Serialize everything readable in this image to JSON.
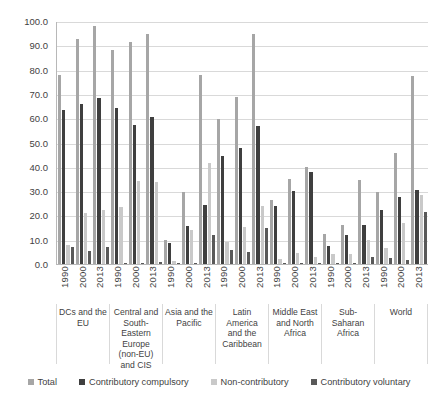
{
  "chart_data": {
    "type": "bar",
    "title": "",
    "subtitle": "",
    "xlabel": "",
    "ylabel": "",
    "ylim": [
      0,
      100
    ],
    "ytick_labels": [
      "100.0",
      "90.0",
      "80.0",
      "70.0",
      "60.0",
      "50.0",
      "40.0",
      "30.0",
      "20.0",
      "10.0",
      "0.0"
    ],
    "ytick_values": [
      100,
      90,
      80,
      70,
      60,
      50,
      40,
      30,
      20,
      10,
      0
    ],
    "grid": true,
    "legend_position": "bottom",
    "colors": {
      "total": "#a6a6a6",
      "contributory_compulsory": "#3f3f3f",
      "non_contributory": "#c9c9c9",
      "contributory_voluntary": "#595959"
    },
    "legend": [
      {
        "label": "Total",
        "color": "#a6a6a6"
      },
      {
        "label": "Contributory compulsory",
        "color": "#3f3f3f"
      },
      {
        "label": "Non-contributory",
        "color": "#c9c9c9"
      },
      {
        "label": "Contributory voluntary",
        "color": "#595959"
      }
    ],
    "series_names": [
      "Total",
      "Contributory compulsory",
      "Non-contributory",
      "Contributory voluntary"
    ],
    "years": [
      "1990",
      "2000",
      "2013"
    ],
    "categories": [
      "DCs and the EU",
      "Central and South-Eastern Europe (non-EU) and CIS",
      "Asia and the Pacific",
      "Latin America and the Caribbean",
      "Middle East and North Africa",
      "Sub-Saharan Africa",
      "World"
    ],
    "groups": [
      {
        "region": "DCs and the EU",
        "bars": [
          {
            "year": "1990",
            "Total": 77.8,
            "Contributory compulsory": 63.5,
            "Non-contributory": 7.8,
            "Contributory voluntary": 6.8
          },
          {
            "year": "2000",
            "Total": 92.5,
            "Contributory compulsory": 66.0,
            "Non-contributory": 21.0,
            "Contributory voluntary": 5.4
          },
          {
            "year": "2013",
            "Total": 97.8,
            "Contributory compulsory": 68.5,
            "Non-contributory": 22.2,
            "Contributory voluntary": 7.2
          }
        ]
      },
      {
        "region": "Central and South-Eastern Europe (non-EU) and CIS",
        "bars": [
          {
            "year": "1990",
            "Total": 88.2,
            "Contributory compulsory": 64.4,
            "Non-contributory": 23.6,
            "Contributory voluntary": 0.6
          },
          {
            "year": "2000",
            "Total": 91.4,
            "Contributory compulsory": 57.2,
            "Non-contributory": 34.0,
            "Contributory voluntary": 0.5
          },
          {
            "year": "2013",
            "Total": 94.8,
            "Contributory compulsory": 60.4,
            "Non-contributory": 33.8,
            "Contributory voluntary": 0.8
          }
        ]
      },
      {
        "region": "Asia and the Pacific",
        "bars": [
          {
            "year": "1990",
            "Total": 9.8,
            "Contributory compulsory": 8.7,
            "Non-contributory": 1.1,
            "Contributory voluntary": 0.4
          },
          {
            "year": "2000",
            "Total": 29.6,
            "Contributory compulsory": 15.6,
            "Non-contributory": 13.8,
            "Contributory voluntary": 0.6
          },
          {
            "year": "2013",
            "Total": 77.6,
            "Contributory compulsory": 24.1,
            "Non-contributory": 41.5,
            "Contributory voluntary": 11.9
          }
        ]
      },
      {
        "region": "Latin America and the Caribbean",
        "bars": [
          {
            "year": "1990",
            "Total": 59.6,
            "Contributory compulsory": 44.5,
            "Non-contributory": 9.2,
            "Contributory voluntary": 5.8
          },
          {
            "year": "2000",
            "Total": 68.8,
            "Contributory compulsory": 47.8,
            "Non-contributory": 15.1,
            "Contributory voluntary": 5.0
          },
          {
            "year": "2013",
            "Total": 94.6,
            "Contributory compulsory": 56.8,
            "Non-contributory": 23.8,
            "Contributory voluntary": 15.0
          }
        ]
      },
      {
        "region": "Middle East and North Africa",
        "bars": [
          {
            "year": "1990",
            "Total": 26.2,
            "Contributory compulsory": 23.8,
            "Non-contributory": 2.2,
            "Contributory voluntary": 0.2
          },
          {
            "year": "2000",
            "Total": 35.0,
            "Contributory compulsory": 30.0,
            "Non-contributory": 4.6,
            "Contributory voluntary": 0.4
          },
          {
            "year": "2013",
            "Total": 40.0,
            "Contributory compulsory": 38.0,
            "Non-contributory": 2.8,
            "Contributory voluntary": 0.3
          }
        ]
      },
      {
        "region": "Sub-Saharan Africa",
        "bars": [
          {
            "year": "1990",
            "Total": 12.5,
            "Contributory compulsory": 7.6,
            "Non-contributory": 4.2,
            "Contributory voluntary": 0.5
          },
          {
            "year": "2000",
            "Total": 16.2,
            "Contributory compulsory": 12.0,
            "Non-contributory": 4.0,
            "Contributory voluntary": 0.6
          },
          {
            "year": "2013",
            "Total": 34.5,
            "Contributory compulsory": 16.2,
            "Non-contributory": 10.0,
            "Contributory voluntary": 2.8
          }
        ]
      },
      {
        "region": "World",
        "bars": [
          {
            "year": "1990",
            "Total": 29.8,
            "Contributory compulsory": 22.2,
            "Non-contributory": 6.6,
            "Contributory voluntary": 2.4
          },
          {
            "year": "2000",
            "Total": 45.6,
            "Contributory compulsory": 27.6,
            "Non-contributory": 17.0,
            "Contributory voluntary": 1.8
          },
          {
            "year": "2013",
            "Total": 77.2,
            "Contributory compulsory": 30.5,
            "Non-contributory": 28.2,
            "Contributory voluntary": 21.6
          }
        ]
      }
    ]
  }
}
